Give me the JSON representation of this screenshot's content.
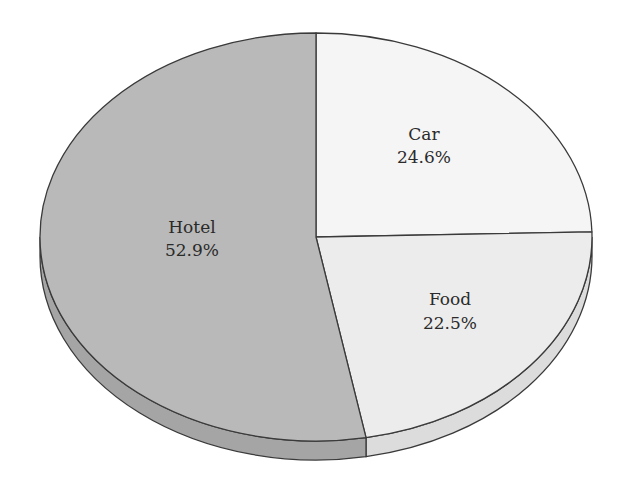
{
  "chart_data": {
    "type": "pie",
    "title": "",
    "style": "3d-tilted",
    "start_angle_deg": 90,
    "direction": "clockwise",
    "slices": [
      {
        "label": "Car",
        "value": 24.6,
        "display": "24.6%",
        "color": "#f5f5f5",
        "side_color": "#e6e6e6"
      },
      {
        "label": "Food",
        "value": 22.5,
        "display": "22.5%",
        "color": "#ececec",
        "side_color": "#dcdcdc"
      },
      {
        "label": "Hotel",
        "value": 52.9,
        "display": "52.9%",
        "color": "#b9b9b9",
        "side_color": "#a5a5a5"
      }
    ],
    "legend": "none",
    "outline_color": "#3a3a3a"
  },
  "labels": {
    "car": {
      "name": "Car",
      "pct": "24.6%"
    },
    "food": {
      "name": "Food",
      "pct": "22.5%"
    },
    "hotel": {
      "name": "Hotel",
      "pct": "52.9%"
    }
  }
}
